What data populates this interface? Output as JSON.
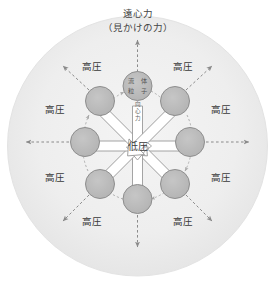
{
  "figure": {
    "type": "physics-diagram",
    "caption_top_line1": "遠心力",
    "caption_top_line2": "（見かけの力）",
    "center_label": "低圧",
    "particle_label_chars": [
      "流",
      "体",
      "粒",
      "子"
    ],
    "centripetal_label_chars": [
      "向",
      "心",
      "力"
    ],
    "high_pressure_label": "高圧",
    "high_pressure_labels": [
      {
        "id": "hp-top-left",
        "text": "高圧",
        "x": 92,
        "y": 67
      },
      {
        "id": "hp-top-right",
        "text": "高圧",
        "x": 183,
        "y": 67
      },
      {
        "id": "hp-left-upper",
        "text": "高圧",
        "x": 55,
        "y": 110
      },
      {
        "id": "hp-right-upper",
        "text": "高圧",
        "x": 221,
        "y": 110
      },
      {
        "id": "hp-left-lower",
        "text": "高圧",
        "x": 55,
        "y": 178
      },
      {
        "id": "hp-right-lower",
        "text": "高圧",
        "x": 221,
        "y": 178
      },
      {
        "id": "hp-bottom-left",
        "text": "高圧",
        "x": 92,
        "y": 222
      },
      {
        "id": "hp-bottom-right",
        "text": "高圧",
        "x": 183,
        "y": 222
      }
    ],
    "particles": [
      {
        "id": "particle-top",
        "angle_deg": -90,
        "x": 137.5,
        "y": 86,
        "r": 14.5,
        "labeled": true
      },
      {
        "id": "particle-top-right",
        "angle_deg": -45,
        "x": 175,
        "y": 101,
        "r": 14.5,
        "labeled": false
      },
      {
        "id": "particle-right",
        "angle_deg": 0,
        "x": 190,
        "y": 142,
        "r": 14.5,
        "labeled": false
      },
      {
        "id": "particle-bottom-right",
        "angle_deg": 45,
        "x": 175,
        "y": 184,
        "r": 14.5,
        "labeled": false
      },
      {
        "id": "particle-bottom",
        "angle_deg": 90,
        "x": 137.5,
        "y": 199,
        "r": 14.5,
        "labeled": false
      },
      {
        "id": "particle-bottom-left",
        "angle_deg": 135,
        "x": 100,
        "y": 184,
        "r": 14.5,
        "labeled": false
      },
      {
        "id": "particle-left",
        "angle_deg": 180,
        "x": 85,
        "y": 142,
        "r": 14.5,
        "labeled": false
      },
      {
        "id": "particle-top-left",
        "angle_deg": -135,
        "x": 100,
        "y": 101,
        "r": 14.5,
        "labeled": false
      }
    ],
    "inward_arrow_count": 8,
    "outward_dashed_arrow_count": 8,
    "rotation_arrow_count": 8,
    "colors": {
      "disc_fill": "#ececec",
      "disc_edge": "#e0e0e0",
      "particle_fill": "#b8b8b8",
      "particle_stroke": "#8e8e8e",
      "block_arrow_fill": "#ffffff",
      "block_arrow_stroke": "#9a9a9a",
      "dashed_arrow": "#8a8a8a",
      "rotation_arrow": "#a8a8a8",
      "text": "#3a3a3a",
      "background": "#ffffff"
    }
  }
}
